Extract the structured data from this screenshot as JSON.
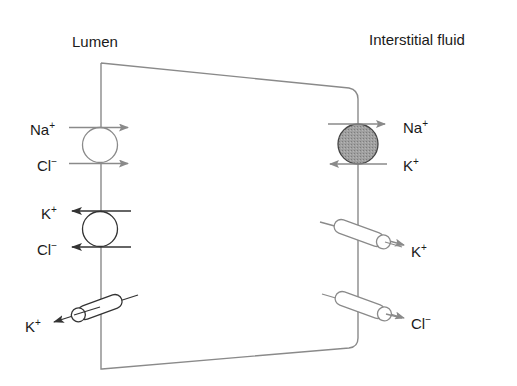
{
  "regions": {
    "lumen": "Lumen",
    "interstitial": "Interstitial fluid"
  },
  "colors": {
    "membrane": "#8a8a8a",
    "outline": "#555555",
    "pump_fill": "#9a9a9a",
    "arrow_gray": "#8a8a8a",
    "arrow_dark": "#333333",
    "text": "#1a1a1a"
  },
  "apical": {
    "cotransporter_nacl": {
      "ions": [
        {
          "base": "Na",
          "charge": "+",
          "direction": "into-cell"
        },
        {
          "base": "Cl",
          "charge": "−",
          "direction": "into-cell"
        }
      ]
    },
    "cotransporter_kcl": {
      "ions": [
        {
          "base": "K",
          "charge": "+",
          "direction": "to-lumen"
        },
        {
          "base": "Cl",
          "charge": "−",
          "direction": "to-lumen"
        }
      ]
    },
    "k_channel": {
      "ion": {
        "base": "K",
        "charge": "+",
        "direction": "to-lumen"
      }
    }
  },
  "basolateral": {
    "na_k_pump": {
      "ions": [
        {
          "base": "Na",
          "charge": "+",
          "direction": "to-interstitium"
        },
        {
          "base": "K",
          "charge": "+",
          "direction": "into-cell"
        }
      ]
    },
    "k_channel": {
      "ion": {
        "base": "K",
        "charge": "+",
        "direction": "to-interstitium"
      }
    },
    "cl_channel": {
      "ion": {
        "base": "Cl",
        "charge": "−",
        "direction": "to-interstitium"
      }
    }
  }
}
